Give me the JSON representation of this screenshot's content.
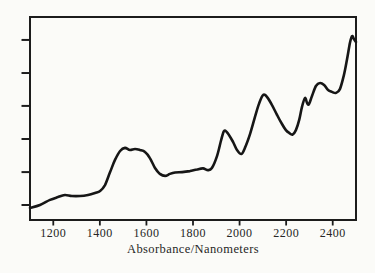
{
  "figure": {
    "background_color": "#fbfbf8",
    "ink_color": "#1a1a1a"
  },
  "chart_data": {
    "type": "line",
    "title": "",
    "xlabel": "Absorbance/Nanometers",
    "ylabel": "",
    "xlim": [
      1100,
      2500
    ],
    "ylim": [
      0,
      1
    ],
    "x_tick_labels": [
      "1200",
      "1400",
      "1600",
      "1800",
      "2000",
      "2200",
      "2400"
    ],
    "x_tick_values": [
      1200,
      1400,
      1600,
      1800,
      2000,
      2200,
      2400
    ],
    "y_tick_values_unlabeled": [
      0.074,
      0.236,
      0.399,
      0.562,
      0.724,
      0.887
    ],
    "grid": false,
    "legend": false,
    "line_color": "#161616",
    "line_width": 2.6,
    "box_color": "#1c1c1c",
    "series": [
      {
        "name": "NIR absorbance spectrum",
        "points": [
          [
            1100,
            0.059
          ],
          [
            1143,
            0.074
          ],
          [
            1186,
            0.099
          ],
          [
            1220,
            0.113
          ],
          [
            1250,
            0.123
          ],
          [
            1280,
            0.118
          ],
          [
            1315,
            0.118
          ],
          [
            1349,
            0.123
          ],
          [
            1379,
            0.133
          ],
          [
            1401,
            0.143
          ],
          [
            1422,
            0.172
          ],
          [
            1444,
            0.236
          ],
          [
            1465,
            0.296
          ],
          [
            1487,
            0.34
          ],
          [
            1508,
            0.355
          ],
          [
            1529,
            0.345
          ],
          [
            1551,
            0.35
          ],
          [
            1572,
            0.345
          ],
          [
            1594,
            0.335
          ],
          [
            1615,
            0.305
          ],
          [
            1637,
            0.256
          ],
          [
            1658,
            0.227
          ],
          [
            1680,
            0.217
          ],
          [
            1701,
            0.227
          ],
          [
            1723,
            0.234
          ],
          [
            1753,
            0.236
          ],
          [
            1787,
            0.241
          ],
          [
            1817,
            0.249
          ],
          [
            1843,
            0.254
          ],
          [
            1864,
            0.246
          ],
          [
            1881,
            0.256
          ],
          [
            1903,
            0.315
          ],
          [
            1920,
            0.389
          ],
          [
            1933,
            0.438
          ],
          [
            1948,
            0.429
          ],
          [
            1972,
            0.384
          ],
          [
            1989,
            0.345
          ],
          [
            2008,
            0.325
          ],
          [
            2023,
            0.355
          ],
          [
            2045,
            0.424
          ],
          [
            2066,
            0.507
          ],
          [
            2083,
            0.571
          ],
          [
            2101,
            0.616
          ],
          [
            2118,
            0.606
          ],
          [
            2139,
            0.567
          ],
          [
            2161,
            0.517
          ],
          [
            2182,
            0.473
          ],
          [
            2199,
            0.443
          ],
          [
            2213,
            0.429
          ],
          [
            2228,
            0.421
          ],
          [
            2242,
            0.443
          ],
          [
            2256,
            0.493
          ],
          [
            2268,
            0.557
          ],
          [
            2281,
            0.601
          ],
          [
            2290,
            0.576
          ],
          [
            2298,
            0.571
          ],
          [
            2311,
            0.611
          ],
          [
            2328,
            0.66
          ],
          [
            2345,
            0.675
          ],
          [
            2363,
            0.665
          ],
          [
            2380,
            0.64
          ],
          [
            2397,
            0.631
          ],
          [
            2414,
            0.626
          ],
          [
            2431,
            0.645
          ],
          [
            2448,
            0.714
          ],
          [
            2461,
            0.788
          ],
          [
            2474,
            0.872
          ],
          [
            2483,
            0.906
          ],
          [
            2491,
            0.892
          ],
          [
            2500,
            0.877
          ]
        ]
      }
    ]
  }
}
